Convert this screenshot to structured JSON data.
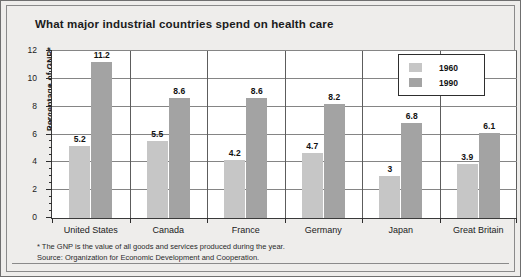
{
  "chart_data": {
    "type": "bar",
    "title": "What major industrial countries spend on health care",
    "xlabel": "",
    "ylabel": "Percentage of GNP*",
    "ylim": [
      0,
      12
    ],
    "ytick_labels": [
      "0",
      "2",
      "4",
      "6",
      "8",
      "10",
      "12"
    ],
    "ytick_values": [
      0,
      2,
      4,
      6,
      8,
      10,
      12
    ],
    "minor_tick_step": 0.5,
    "grid": true,
    "legend_position": "top-right",
    "categories": [
      "United States",
      "Canada",
      "France",
      "Germany",
      "Japan",
      "Great Britain"
    ],
    "series": [
      {
        "name": "1960",
        "color": "#c6c6c6",
        "values": [
          5.2,
          5.5,
          4.2,
          4.7,
          3,
          3.9
        ],
        "labels": [
          "5.2",
          "5.5",
          "4.2",
          "4.7",
          "3",
          "3.9"
        ]
      },
      {
        "name": "1990",
        "color": "#a3a3a3",
        "values": [
          11.2,
          8.6,
          8.6,
          8.2,
          6.8,
          6.1
        ],
        "labels": [
          "11.2",
          "8.6",
          "8.6",
          "8.2",
          "6.8",
          "6.1"
        ]
      }
    ]
  },
  "legend": {
    "entries": [
      {
        "label": "1960",
        "swatch": "y1960"
      },
      {
        "label": "1990",
        "swatch": "y1990"
      }
    ]
  },
  "footnotes": {
    "line1": "* The GNP is the value of all goods and services produced during the year.",
    "line2": "Source: Organization for Economic Development and Cooperation."
  },
  "colors": {
    "series_1960": "#c6c6c6",
    "series_1990": "#a3a3a3",
    "plot_background": "#ffffff",
    "figure_background": "#eeedeb",
    "axis": "#2e2e2e",
    "gridline": "#858585"
  }
}
